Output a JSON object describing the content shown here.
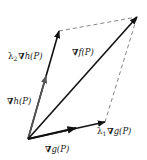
{
  "diagram": {
    "type": "vector-parallelogram",
    "colors": {
      "vector": "#111111",
      "grad_h_segment": "#555555",
      "dashed": "#777777",
      "background": "#ffffff"
    },
    "points": {
      "P": [
        28,
        139
      ],
      "grad_f_tip": [
        137,
        17
      ],
      "lambda2_grad_h_tip": [
        59,
        31
      ],
      "grad_h_tip": [
        46,
        76
      ],
      "lambda1_grad_g_tip": [
        105,
        122
      ],
      "grad_g_tip": [
        76,
        128
      ]
    },
    "labels": {
      "grad_f": {
        "nabla": "∇",
        "text": "f(P)"
      },
      "grad_h": {
        "nabla": "∇",
        "text": "h(P)"
      },
      "grad_g": {
        "nabla": "∇",
        "text": "g(P)"
      },
      "lambda2_grad_h": {
        "lambda": "λ",
        "sub": "2",
        "nabla": "∇",
        "text": "h(P)"
      },
      "lambda1_grad_g": {
        "lambda": "λ",
        "sub": "1",
        "nabla": "∇",
        "text": "g(P)"
      }
    }
  }
}
